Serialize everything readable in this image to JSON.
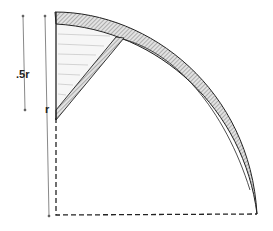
{
  "labels": {
    "half_r": ".5r",
    "r": "r"
  },
  "colors": {
    "ink": "#222222",
    "hatch": "#9a9a9a",
    "fill": "#f4f4f4"
  }
}
